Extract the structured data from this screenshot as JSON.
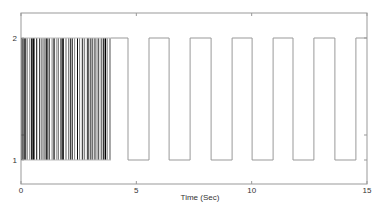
{
  "chart_data": {
    "type": "line",
    "title": "",
    "xlabel": "Time (Sec)",
    "ylabel": "",
    "xlim": [
      0,
      15
    ],
    "ylim": [
      0.35,
      2.2
    ],
    "xticks": [
      0,
      5,
      10,
      15
    ],
    "xtick_labels": [
      "0",
      "5",
      "10",
      "15"
    ],
    "yticks": [
      1,
      2
    ],
    "ytick_labels": [
      "1",
      "2"
    ],
    "grid": false,
    "legend": null,
    "series": [
      {
        "name": "signal",
        "description": "Binary signal switching between levels 1 and 2; rapid irregular switching from t=0 to ~3.9 s, then a regular square wave with period ~1.8 s",
        "dense_region": {
          "t_start": 0.0,
          "t_end": 3.9,
          "low": 1,
          "high": 2
        },
        "square_wave_edges": [
          {
            "t": 3.9,
            "level": 2
          },
          {
            "t": 4.64,
            "level": 1
          },
          {
            "t": 5.55,
            "level": 2
          },
          {
            "t": 6.42,
            "level": 1
          },
          {
            "t": 7.33,
            "level": 2
          },
          {
            "t": 8.24,
            "level": 1
          },
          {
            "t": 9.15,
            "level": 2
          },
          {
            "t": 10.02,
            "level": 1
          },
          {
            "t": 10.93,
            "level": 2
          },
          {
            "t": 11.79,
            "level": 1
          },
          {
            "t": 12.7,
            "level": 2
          },
          {
            "t": 13.61,
            "level": 1
          },
          {
            "t": 14.52,
            "level": 2
          },
          {
            "t": 15.0,
            "level": 2
          }
        ]
      }
    ]
  }
}
